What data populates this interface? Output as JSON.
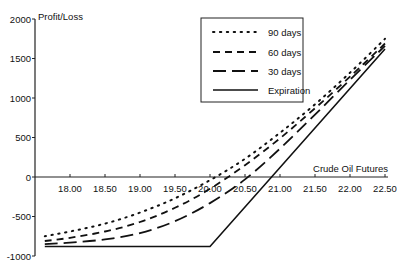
{
  "chart_data": {
    "type": "line",
    "title": "",
    "xlabel": "Crude Oil Futures",
    "ylabel": "Profit/Loss",
    "xlim": [
      17.64,
      22.54
    ],
    "ylim": [
      -1000,
      2000
    ],
    "x_ticks": [
      "18.00",
      "18.50",
      "19.00",
      "19.50",
      "20.00",
      "20.50",
      "21.00",
      "21.50",
      "22.00",
      "22.50"
    ],
    "y_ticks": [
      "2000",
      "1500",
      "1000",
      "500",
      "0",
      "-500",
      "-1000"
    ],
    "grid": false,
    "legend_position": "upper-center-right",
    "series": [
      {
        "name": "90 days",
        "style": "dotted",
        "x": [
          17.64,
          18.0,
          18.5,
          19.0,
          19.5,
          20.0,
          20.5,
          21.0,
          21.5,
          22.0,
          22.5
        ],
        "y": [
          -750,
          -690,
          -590,
          -450,
          -270,
          -40,
          230,
          560,
          920,
          1320,
          1750
        ]
      },
      {
        "name": "60 days",
        "style": "dashed",
        "x": [
          17.64,
          18.0,
          18.5,
          19.0,
          19.5,
          20.0,
          20.5,
          21.0,
          21.5,
          22.0,
          22.5
        ],
        "y": [
          -810,
          -770,
          -690,
          -570,
          -390,
          -150,
          150,
          490,
          870,
          1270,
          1690
        ]
      },
      {
        "name": "30 days",
        "style": "long-dashed",
        "x": [
          17.64,
          18.0,
          18.5,
          19.0,
          19.5,
          20.0,
          20.5,
          21.0,
          21.5,
          22.0,
          22.5
        ],
        "y": [
          -850,
          -830,
          -790,
          -710,
          -560,
          -330,
          -30,
          360,
          790,
          1230,
          1660
        ]
      },
      {
        "name": "Expiration",
        "style": "solid",
        "x": [
          17.64,
          20.0,
          22.5
        ],
        "y": [
          -880,
          -880,
          1620
        ]
      }
    ]
  }
}
